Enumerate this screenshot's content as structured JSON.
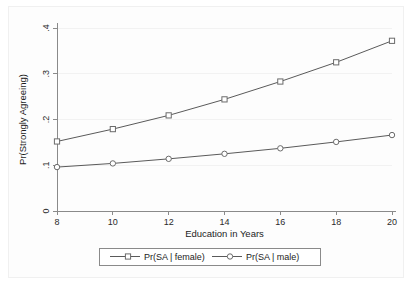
{
  "chart_data": {
    "type": "line",
    "title": "",
    "xlabel": "Education in Years",
    "ylabel": "Pr(Strongly Agreeing)",
    "x": [
      8,
      10,
      12,
      14,
      16,
      18,
      20
    ],
    "xlim": [
      8,
      20
    ],
    "ylim": [
      0,
      0.4
    ],
    "xticks": [
      8,
      10,
      12,
      14,
      16,
      18,
      20
    ],
    "xtick_labels": [
      "8",
      "10",
      "12",
      "14",
      "16",
      "18",
      "20"
    ],
    "yticks": [
      0,
      0.1,
      0.2,
      0.3,
      0.4
    ],
    "ytick_labels": [
      "0",
      ".1",
      ".2",
      ".3",
      ".4"
    ],
    "grid": "horizontal",
    "legend_position": "below",
    "series": [
      {
        "name": "Pr(SA | female)",
        "marker": "square",
        "color": "#5a5a5a",
        "values": [
          0.152,
          0.179,
          0.209,
          0.244,
          0.283,
          0.325,
          0.372
        ]
      },
      {
        "name": "Pr(SA | male)",
        "marker": "circle",
        "color": "#5a5a5a",
        "values": [
          0.096,
          0.104,
          0.114,
          0.125,
          0.137,
          0.151,
          0.166
        ]
      }
    ]
  },
  "legend": {
    "entries": [
      {
        "label": "Pr(SA | female)"
      },
      {
        "label": "Pr(SA | male)"
      }
    ]
  },
  "axes": {
    "x_title": "Education in Years",
    "y_title": "Pr(Strongly Agreeing)"
  }
}
